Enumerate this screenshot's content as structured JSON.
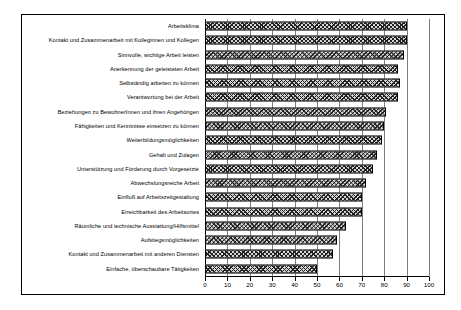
{
  "chart_data": {
    "type": "bar",
    "orientation": "horizontal",
    "title": "",
    "subtitle": "",
    "xlabel": "",
    "ylabel": "",
    "xlim": [
      0,
      100
    ],
    "xticks": [
      0,
      10,
      20,
      30,
      40,
      50,
      60,
      70,
      80,
      90,
      100
    ],
    "grid": true,
    "legend": null,
    "legend_position": "none",
    "bar_style": {
      "fill": "cross-hatch",
      "edge_color": "#000000",
      "face_color": "#d4d4d4"
    },
    "categories": [
      "Arbeitsklima",
      "Kontakt und Zusammenarbeit mit Kolleginnen und Kollegen",
      "Sinnvolle, wichtige Arbeit leisten",
      "Anerkennung der geleisteten Arbeit",
      "Selbständig arbeiten zu können",
      "Verantwortung bei der Arbeit",
      "Beziehungen zu BewohnerInnen und ihren Angehörigen",
      "Fähigkeiten und Kenntnisse einsetzen zu können",
      "Weiterbildungsmöglichkeiten",
      "Gehalt und Zulagen",
      "Unterstützung und Förderung durch Vorgesetzte",
      "Abwechslungsreiche Arbeit",
      "Einfluß auf Arbeitszeitgestaltung",
      "Erreichbarkeit des Arbeitsortes",
      "Räumliche und technische Ausstattung/Hilfsmittel",
      "Aufstiegsmöglichkeiten",
      "Kontakt und Zusammenarbeit mit anderen Diensten",
      "Einfache, überschaubare Tätigkeiten"
    ],
    "values": [
      90,
      90,
      89,
      86,
      87,
      86,
      81,
      80,
      79,
      77,
      75,
      72,
      70,
      70,
      63,
      59,
      57,
      50
    ]
  }
}
